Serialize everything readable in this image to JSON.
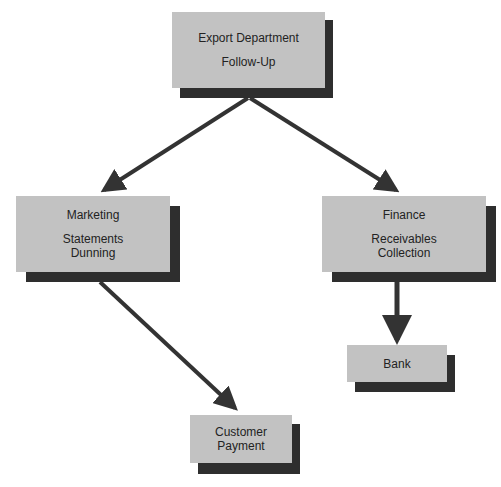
{
  "colors": {
    "box_fill": "#c2c2c2",
    "shadow": "#2e2e2e",
    "arrow": "#333333",
    "text": "#222222"
  },
  "nodes": {
    "export": {
      "title": "Export Department",
      "line1": "Follow-Up"
    },
    "marketing": {
      "title": "Marketing",
      "line1": "Statements",
      "line2": "Dunning"
    },
    "finance": {
      "title": "Finance",
      "line1": "Receivables",
      "line2": "Collection"
    },
    "bank": {
      "title": "Bank"
    },
    "customer": {
      "line1": "Customer",
      "line2": "Payment"
    }
  },
  "edges": [
    {
      "from": "export",
      "to": "marketing"
    },
    {
      "from": "export",
      "to": "finance"
    },
    {
      "from": "marketing",
      "to": "customer"
    },
    {
      "from": "finance",
      "to": "bank"
    }
  ]
}
